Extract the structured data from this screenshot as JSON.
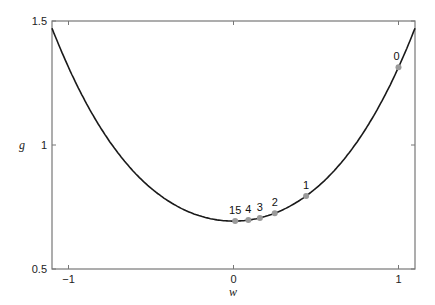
{
  "chart_data": {
    "type": "line",
    "title": "",
    "xlabel": "w",
    "ylabel": "g",
    "xlim": [
      -1.1,
      1.1
    ],
    "ylim": [
      0.5,
      1.5
    ],
    "xticks": [
      -1,
      0,
      1
    ],
    "xtick_labels": [
      "−1",
      "0",
      "1"
    ],
    "yticks": [
      0.5,
      1,
      1.5
    ],
    "ytick_labels": [
      "0.5",
      "1",
      "1.5"
    ],
    "grid": false,
    "curve": {
      "name": "g(w) = log(1 + e^{w^2})",
      "color": "#1a1a1a",
      "x": [
        -1.1,
        -1.0,
        -0.9,
        -0.8,
        -0.7,
        -0.6,
        -0.5,
        -0.4,
        -0.3,
        -0.2,
        -0.1,
        0.0,
        0.1,
        0.2,
        0.3,
        0.4,
        0.5,
        0.6,
        0.7,
        0.8,
        0.9,
        1.0,
        1.1
      ],
      "y": [
        1.47,
        1.31,
        1.16,
        1.04,
        0.93,
        0.85,
        0.78,
        0.73,
        0.71,
        0.7,
        0.69,
        0.69,
        0.69,
        0.7,
        0.71,
        0.73,
        0.78,
        0.85,
        0.93,
        1.04,
        1.16,
        1.31,
        1.47
      ]
    },
    "points": {
      "color": "#9a9a9a",
      "items": [
        {
          "label": "0",
          "x": 1.0,
          "y": 1.31
        },
        {
          "label": "1",
          "x": 0.44,
          "y": 0.79
        },
        {
          "label": "2",
          "x": 0.25,
          "y": 0.72
        },
        {
          "label": "3",
          "x": 0.16,
          "y": 0.7
        },
        {
          "label": "4",
          "x": 0.09,
          "y": 0.7
        },
        {
          "label": "15",
          "x": 0.01,
          "y": 0.69
        }
      ]
    }
  }
}
